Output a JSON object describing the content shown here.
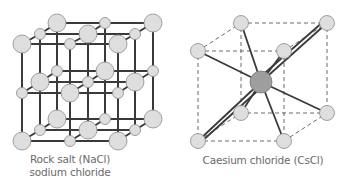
{
  "figure": {
    "panels": [
      {
        "id": "nacl",
        "caption_line1": "Rock salt (NaCl)",
        "caption_line2": "sodium chloride",
        "structure": "face-centered cubic lattice, 3x3x3 alternating large and small ions"
      },
      {
        "id": "cscl",
        "caption_line1": "Caesium chloride (CsCl)",
        "structure": "body-centered cubic: central ion bonded to 8 corner ions"
      }
    ]
  },
  "colors": {
    "ion_fill": "#dedede",
    "ion_stroke": "#8a8a8a",
    "center_ion_fill": "#9e9e9e",
    "bond": "#3a3a3a",
    "dashed_edge": "#6a6a6a",
    "caption": "#6a6a6a"
  }
}
